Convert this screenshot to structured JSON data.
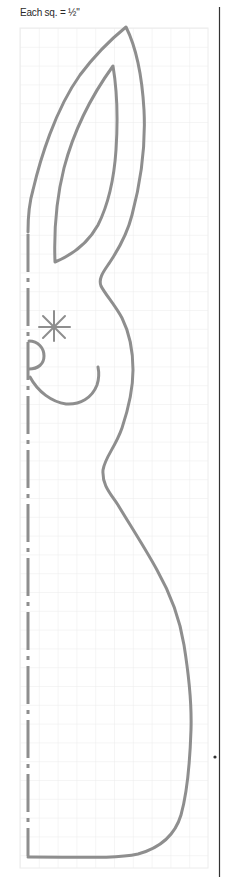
{
  "caption": {
    "text": "Each sq. = ½\""
  },
  "pattern": {
    "subject": "bunny",
    "grid": {
      "x": 20,
      "y": 28,
      "width": 188,
      "height": 840,
      "cell_size": 18.9,
      "line_color": "#ececec"
    },
    "outline": {
      "stroke_color": "#8e8e8e",
      "stroke_width": 3
    },
    "fold_line": {
      "style": "dashed",
      "x": 28,
      "y_start": 230,
      "y_end": 857
    },
    "eye": {
      "glyph": "asterisk",
      "cx": 54,
      "cy": 327
    },
    "divider": {
      "x": 219,
      "y_start": 7,
      "y_end": 877,
      "color": "#333333"
    },
    "stray_mark": {
      "x": 215,
      "y": 757
    }
  }
}
